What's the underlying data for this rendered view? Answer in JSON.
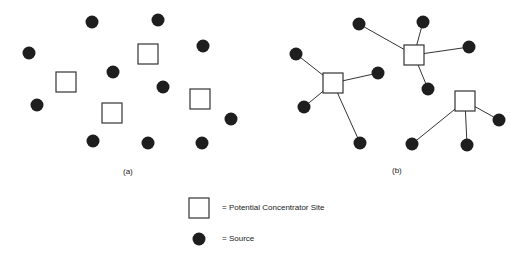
{
  "panels": [
    {
      "id": "a",
      "label": "(a)",
      "label_pos": [
        128,
        173
      ],
      "sources": [
        [
          92,
          22
        ],
        [
          158,
          20
        ],
        [
          29,
          53
        ],
        [
          203,
          46
        ],
        [
          113,
          72
        ],
        [
          163,
          87
        ],
        [
          37,
          105
        ],
        [
          231,
          119
        ],
        [
          93,
          141
        ],
        [
          148,
          143
        ],
        [
          202,
          143
        ]
      ],
      "concentrators": [
        [
          148,
          54
        ],
        [
          66,
          82
        ],
        [
          112,
          113
        ],
        [
          200,
          99
        ]
      ],
      "links": []
    },
    {
      "id": "b",
      "label": "(b)",
      "label_pos": [
        397,
        172
      ],
      "concentrators": [
        [
          414,
          55
        ],
        [
          333,
          83
        ],
        [
          465,
          101
        ]
      ],
      "sources": [
        [
          359,
          24
        ],
        [
          423,
          22
        ],
        [
          469,
          47
        ],
        [
          428,
          89
        ],
        [
          296,
          54
        ],
        [
          378,
          73
        ],
        [
          304,
          107
        ],
        [
          360,
          143
        ],
        [
          499,
          120
        ],
        [
          467,
          145
        ],
        [
          412,
          144
        ]
      ],
      "links": [
        [
          0,
          [
            359,
            24
          ]
        ],
        [
          0,
          [
            423,
            22
          ]
        ],
        [
          0,
          [
            469,
            47
          ]
        ],
        [
          0,
          [
            428,
            89
          ]
        ],
        [
          1,
          [
            296,
            54
          ]
        ],
        [
          1,
          [
            378,
            73
          ]
        ],
        [
          1,
          [
            304,
            107
          ]
        ],
        [
          1,
          [
            360,
            143
          ]
        ],
        [
          2,
          [
            499,
            120
          ]
        ],
        [
          2,
          [
            467,
            145
          ]
        ],
        [
          2,
          [
            412,
            144
          ]
        ]
      ]
    }
  ],
  "legend": {
    "concentrator_label": "= Potential Concentrator Site",
    "source_label": "= Source"
  },
  "style": {
    "source_color": "#1e1e1e",
    "square_stroke": "#333333",
    "line_color": "#333333",
    "source_radius": 6.5,
    "square_size": 20
  }
}
